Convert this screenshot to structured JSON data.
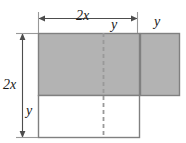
{
  "figure": {
    "colors": {
      "shade_fill": "#b3b3b3",
      "outline": "#808080",
      "dimension_line": "#4d4d4d",
      "dashed_line": "#999999",
      "text": "#1a1a1a",
      "background": "#ffffff"
    },
    "labels": {
      "width_top": "2x",
      "segment_mid": "y",
      "segment_right": "y",
      "height_left": "2x",
      "height_lower": "y"
    },
    "geometry": {
      "main_rect": {
        "x": 38,
        "y": 33,
        "width": 102,
        "height": 105
      },
      "shaded_left": {
        "x": 38,
        "y": 33,
        "width": 102,
        "height": 63
      },
      "shaded_right": {
        "x": 140,
        "y": 33,
        "width": 40,
        "height": 63
      },
      "dashed_x": 103,
      "dashed_y1": 33,
      "dashed_y2": 138,
      "dim_top": {
        "y": 18,
        "x1": 38,
        "x2": 138
      },
      "dim_left": {
        "x": 22,
        "y1": 33,
        "y2": 138
      },
      "tick_top_left_x": 38,
      "tick_top_right_x": 138,
      "divider_y": 96
    }
  }
}
